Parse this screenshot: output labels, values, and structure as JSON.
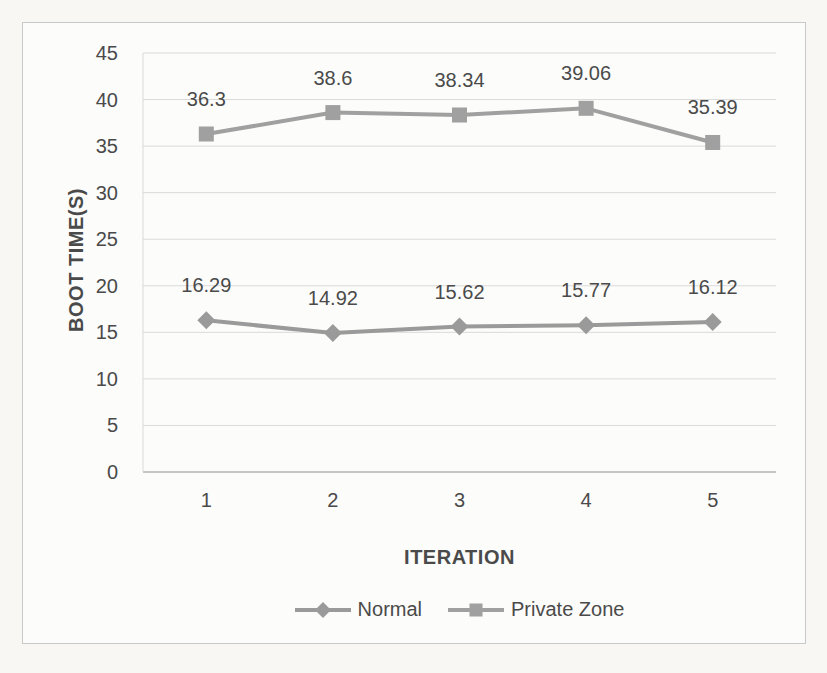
{
  "page": {
    "background": "#f8f7f4"
  },
  "chart": {
    "frame": {
      "background": "#fcfcfa",
      "border_color": "#c9c9c9"
    },
    "text_color": "#4a4a4a",
    "gridline_color": "#dadada",
    "axis_line_color": "#b3b3b3",
    "plot": {
      "left": 120,
      "top": 30,
      "right": 753,
      "bottom": 449
    }
  },
  "chart_data": {
    "type": "line",
    "title": "",
    "xlabel": "ITERATION",
    "ylabel": "BOOT TIME(S)",
    "categories": [
      "1",
      "2",
      "3",
      "4",
      "5"
    ],
    "ylim": [
      0,
      45
    ],
    "ytick_step": 5,
    "yticks": [
      0,
      5,
      10,
      15,
      20,
      25,
      30,
      35,
      40,
      45
    ],
    "grid": true,
    "data_labels": true,
    "legend_position": "bottom",
    "series": [
      {
        "name": "Normal",
        "marker": "diamond",
        "color": "#9a9a9a",
        "values": [
          16.29,
          14.92,
          15.62,
          15.77,
          16.12
        ]
      },
      {
        "name": "Private Zone",
        "marker": "square",
        "color": "#a0a0a0",
        "values": [
          36.3,
          38.6,
          38.34,
          39.06,
          35.39
        ]
      }
    ]
  }
}
